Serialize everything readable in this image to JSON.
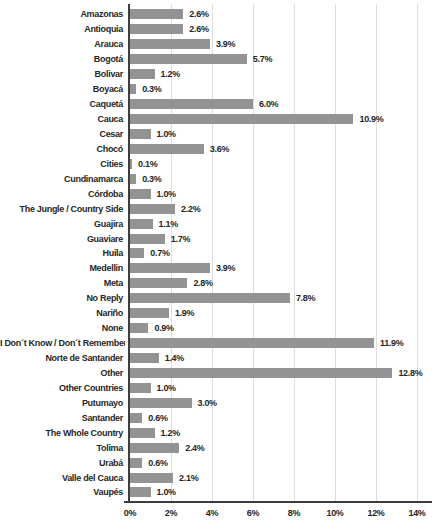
{
  "chart_data": {
    "type": "bar",
    "orientation": "horizontal",
    "title": "",
    "xlabel": "",
    "ylabel": "",
    "xlim": [
      0,
      14
    ],
    "grid": true,
    "legend": false,
    "bar_color": "#939393",
    "axis_color": "#3d3d3d",
    "gridline_color": "#dedede",
    "text_color": "#262626",
    "x_ticks": [
      {
        "value": 0,
        "label": "0%"
      },
      {
        "value": 2,
        "label": "2%"
      },
      {
        "value": 4,
        "label": "4%"
      },
      {
        "value": 6,
        "label": "6%"
      },
      {
        "value": 8,
        "label": "8%"
      },
      {
        "value": 10,
        "label": "10%"
      },
      {
        "value": 12,
        "label": "12%"
      },
      {
        "value": 14,
        "label": "14%"
      }
    ],
    "categories": [
      "Amazonas",
      "Antioquia",
      "Arauca",
      "Bogotá",
      "Bolivar",
      "Boyacá",
      "Caquetá",
      "Cauca",
      "Cesar",
      "Chocó",
      "Cities",
      "Cundinamarca",
      "Córdoba",
      "The Jungle / Country Side",
      "Guajira",
      "Guaviare",
      "Huila",
      "Medellin",
      "Meta",
      "No Reply",
      "Nariño",
      "None",
      "I Don´t Know / Don´t Remember",
      "Norte de Santander",
      "Other",
      "Other Countries",
      "Putumayo",
      "Santander",
      "The Whole Country",
      "Tolima",
      "Urabá",
      "Valle del Cauca",
      "Vaupés"
    ],
    "values": [
      2.6,
      2.6,
      3.9,
      5.7,
      1.2,
      0.3,
      6.0,
      10.9,
      1.0,
      3.6,
      0.1,
      0.3,
      1.0,
      2.2,
      1.1,
      1.7,
      0.7,
      3.9,
      2.8,
      7.8,
      1.9,
      0.9,
      11.9,
      1.4,
      12.8,
      1.0,
      3.0,
      0.6,
      1.2,
      2.4,
      0.6,
      2.1,
      1.0
    ],
    "value_labels": [
      "2.6%",
      "2.6%",
      "3.9%",
      "5.7%",
      "1.2%",
      "0.3%",
      "6.0%",
      "10.9%",
      "1.0%",
      "3.6%",
      "0.1%",
      "0.3%",
      "1.0%",
      "2.2%",
      "1.1%",
      "1.7%",
      "0.7%",
      "3.9%",
      "2.8%",
      "7.8%",
      "1.9%",
      "0.9%",
      "11.9%",
      "1.4%",
      "12.8%",
      "1.0%",
      "3.0%",
      "0.6%",
      "1.2%",
      "2.4%",
      "0.6%",
      "2.1%",
      "1.0%"
    ]
  }
}
